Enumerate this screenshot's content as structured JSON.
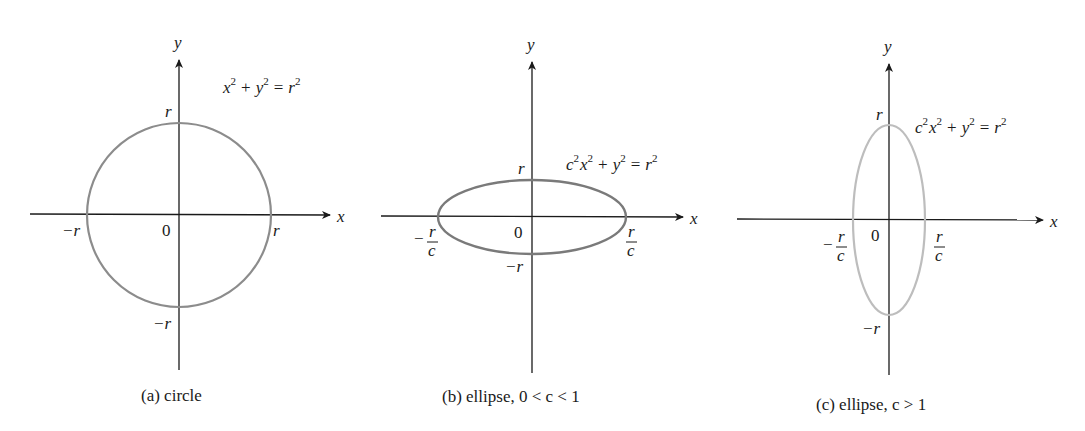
{
  "figure": {
    "panels": [
      {
        "id": "a",
        "caption": "(a) circle",
        "equation": {
          "a": "x",
          "b": "y",
          "rhs": "r",
          "prefix": ""
        },
        "axes": {
          "x_label": "x",
          "y_label": "y"
        },
        "labels": {
          "origin": "0",
          "x_pos": "r",
          "x_neg": "−r",
          "y_pos": "r",
          "y_neg": "−r"
        },
        "shape": {
          "type": "circle",
          "stroke": "#8c8c8c"
        }
      },
      {
        "id": "b",
        "caption": "(b) ellipse, 0 < c < 1",
        "equation": {
          "prefix": "c",
          "a": "x",
          "b": "y",
          "rhs": "r"
        },
        "axes": {
          "x_label": "x",
          "y_label": "y"
        },
        "labels": {
          "origin": "0",
          "x_pos_num": "r",
          "x_pos_den": "c",
          "x_neg_sign": "−",
          "x_neg_num": "r",
          "x_neg_den": "c",
          "y_pos": "r",
          "y_neg": "−r"
        },
        "shape": {
          "type": "ellipse",
          "orientation": "wide",
          "stroke": "#7a7a7a"
        }
      },
      {
        "id": "c",
        "caption": "(c) ellipse,  c > 1",
        "equation": {
          "prefix": "c",
          "a": "x",
          "b": "y",
          "rhs": "r"
        },
        "axes": {
          "x_label": "x",
          "y_label": "y"
        },
        "labels": {
          "origin": "0",
          "x_pos_num": "r",
          "x_pos_den": "c",
          "x_neg_sign": "−",
          "x_neg_num": "r",
          "x_neg_den": "c",
          "y_pos": "r",
          "y_neg": "−r"
        },
        "shape": {
          "type": "ellipse",
          "orientation": "tall",
          "stroke": "#bdbdbd"
        }
      }
    ],
    "superscript": "2",
    "plus": "+",
    "equals": "="
  }
}
